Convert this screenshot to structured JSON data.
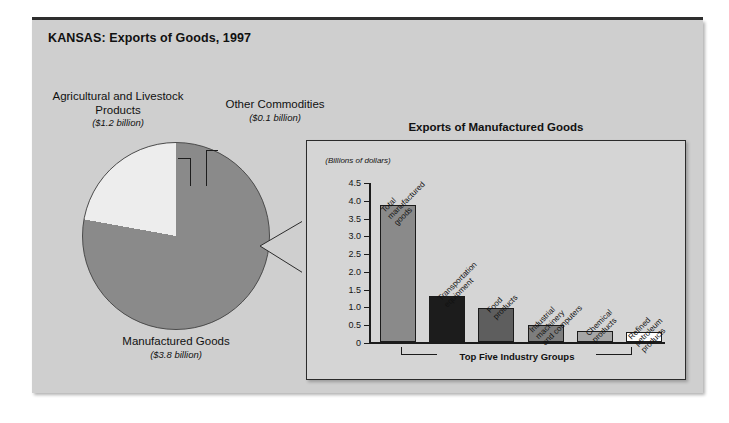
{
  "figure": {
    "title": "KANSAS: Exports of Goods, 1997",
    "panel_bg": "#cfcfcf",
    "inset_bg": "#d5d5d5",
    "inset_title": "Exports of Manufactured Goods",
    "axis_units": "(Billions of\ndollars)",
    "bracket_label": "Top Five Industry Groups"
  },
  "pie_labels": {
    "agricultural_name": "Agricultural and\nLivestock Products",
    "agricultural_value": "($1.2 billion)",
    "other_name": "Other Commodities",
    "other_value": "($0.1 billion)",
    "manufactured_name": "Manufactured\nGoods",
    "manufactured_value": "($3.8 billion)"
  },
  "chart_data": [
    {
      "type": "pie",
      "title": "KANSAS: Exports of Goods, 1997",
      "unit": "billions of dollars",
      "labels": [
        "Manufactured Goods",
        "Agricultural and Livestock Products",
        "Other Commodities"
      ],
      "values": [
        3.8,
        1.2,
        0.1
      ],
      "value_labels": [
        "($3.8 billion)",
        "($1.2 billion)",
        "($0.1 billion)"
      ],
      "colors": [
        "#8a8a8a",
        "#ededed",
        "#2b2b2b"
      ],
      "legend": "labels placed around pie with leader lines"
    },
    {
      "type": "bar",
      "title": "Exports of Manufactured Goods",
      "ylabel": "(Billions of dollars)",
      "xlabel": "Top Five Industry Groups",
      "categories": [
        "Total\nmanufactured\ngoods",
        "Transportation\nequipment",
        "Food\nproducts",
        "Industrial\nmachinery\nand computers",
        "Chemical\nproducts",
        "Refined\npetroleum\nproducts"
      ],
      "values": [
        3.85,
        1.3,
        0.95,
        0.48,
        0.3,
        0.28
      ],
      "bar_colors": [
        "#8a8a8a",
        "#1c1c1c",
        "#5e5e5e",
        "#7d7d7d",
        "#a6a6a6",
        "#ffffff"
      ],
      "ylim": [
        0,
        4.5
      ],
      "yticks": [
        0,
        0.5,
        1.0,
        1.5,
        2.0,
        2.5,
        3.0,
        3.5,
        4.0,
        4.5
      ],
      "ytick_labels": [
        "0",
        "0.5",
        "1.0",
        "1.5",
        "2.0",
        "2.5",
        "3.0",
        "3.5",
        "4.0",
        "4.5"
      ],
      "grid": false,
      "legend": "none",
      "bracket_covers": [
        1,
        2,
        3,
        4,
        5
      ]
    }
  ]
}
